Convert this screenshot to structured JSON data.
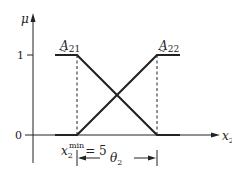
{
  "diagram": {
    "type": "fuzzy-membership-functions",
    "y_axis": {
      "label": "μ",
      "ticks": [
        "1",
        "0"
      ]
    },
    "x_axis": {
      "label": "x",
      "label_subscript": "2"
    },
    "sets": [
      {
        "name": "A",
        "subscript": "21",
        "shape": "Z (left shoulder)"
      },
      {
        "name": "A",
        "subscript": "22",
        "shape": "S (right shoulder)"
      }
    ],
    "annotations": {
      "xmin_base": "x",
      "xmin_sub": "2",
      "xmin_sup": "min",
      "xmin_value": "= 5",
      "width_label": "θ",
      "width_sub": "2"
    },
    "colors": {
      "line": "#222222",
      "background": "#ffffff"
    }
  }
}
